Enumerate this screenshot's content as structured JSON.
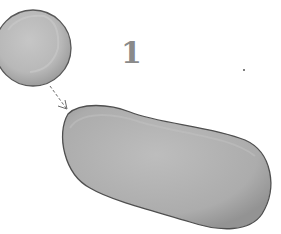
{
  "diagram": {
    "step_number": "1",
    "elements": [
      {
        "id": "round-cell",
        "shape": "circle",
        "fill": "#b5b5b5",
        "stroke": "#5a5a5a"
      },
      {
        "id": "arrow",
        "shape": "dashed-arrow",
        "from": "round-cell",
        "to": "elongated-cell",
        "stroke": "#6a6a6a"
      },
      {
        "id": "elongated-cell",
        "shape": "bean",
        "fill": "#aaaaaa",
        "stroke": "#4f4f4f"
      }
    ]
  },
  "colors": {
    "cell_fill": "#b5b5b5",
    "cell_highlight": "#c8c8c8",
    "cell_outline": "#555555",
    "label": "#8a8a8a"
  }
}
